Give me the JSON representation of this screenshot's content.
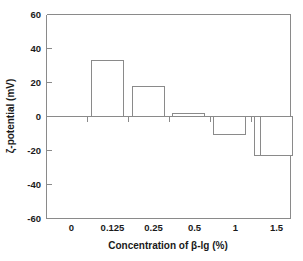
{
  "chart_data": {
    "type": "bar",
    "title": "",
    "categories": [
      "0",
      "0.125",
      "0.25",
      "0.5",
      "1",
      "1.5"
    ],
    "values": [
      51.8,
      33.0,
      17.6,
      1.8,
      -10.5,
      -22.8
    ],
    "xlabel": "Concentration of β-lg (%)",
    "ylabel": "ζ-potential (mV)",
    "ylim": [
      -60,
      60
    ],
    "yticks": [
      60,
      40,
      20,
      0,
      -20,
      -40,
      -60
    ],
    "ytick_labels": [
      "60",
      "40",
      "20",
      "0",
      "-20",
      "-40",
      "-60"
    ],
    "grid": false,
    "legend": null,
    "bar_fill": "#ffffff",
    "bar_stroke": "#8a8a8a",
    "axis_color": "#8a8a8a",
    "background": "#ffffff"
  }
}
